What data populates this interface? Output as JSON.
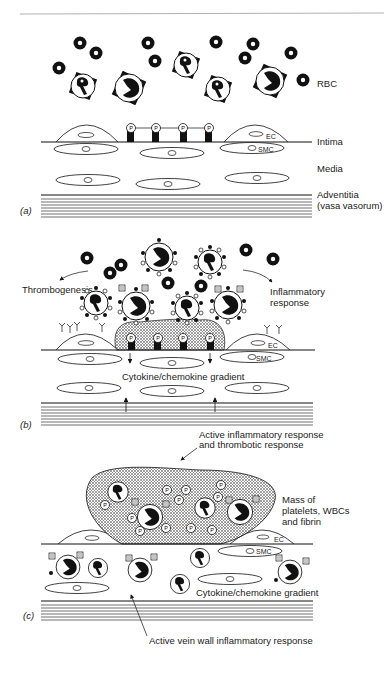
{
  "figure": {
    "colors": {
      "ink": "#111111",
      "rule": "#b0b0b0",
      "hatch": "#8a8a8a",
      "text": "#222222"
    },
    "panels": [
      {
        "id": "a",
        "label": "(a)",
        "cell_labels": {
          "neutrophil": "N",
          "monocyte": "M",
          "platelet": "P",
          "endothelial": "EC",
          "smooth_muscle": "SMC"
        },
        "layer_labels": {
          "rbc": "RBC",
          "intima": "Intima",
          "media": "Media",
          "adventitia": "Adventitia",
          "adventitia_sub": "(vasa vasorum)"
        }
      },
      {
        "id": "b",
        "label": "(b)",
        "annotations": {
          "left": "Thrombogenesis",
          "right_line1": "Inflammatory",
          "right_line2": "response",
          "gradient": "Cytokine/chemokine gradient"
        },
        "cell_labels": {
          "endothelial": "EC",
          "smooth_muscle": "SMC"
        }
      },
      {
        "id": "c",
        "label": "(c)",
        "annotations": {
          "top_line1": "Active inflammatory response",
          "top_line2": "and thrombotic response",
          "mass_line1": "Mass of",
          "mass_line2": "platelets, WBCs",
          "mass_line3": "and fibrin",
          "gradient": "Cytokine/chemokine gradient",
          "bottom": "Active vein wall inflammatory response"
        },
        "cell_labels": {
          "endothelial": "EC",
          "smooth_muscle": "SMC"
        }
      }
    ]
  }
}
